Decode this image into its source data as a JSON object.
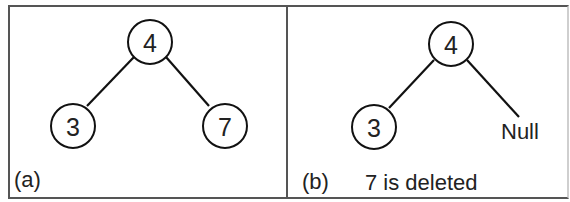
{
  "panels": [
    {
      "id": "a",
      "label": "(a)",
      "caption": "",
      "nodes": [
        {
          "value": "4",
          "role": "root"
        },
        {
          "value": "3",
          "role": "left-child"
        },
        {
          "value": "7",
          "role": "right-child"
        }
      ]
    },
    {
      "id": "b",
      "label": "(b)",
      "caption": "7 is deleted",
      "nodes": [
        {
          "value": "4",
          "role": "root"
        },
        {
          "value": "3",
          "role": "left-child"
        }
      ],
      "null_label": "Null"
    }
  ],
  "colors": {
    "stroke": "#111111",
    "border": "#555555",
    "text": "#222222"
  }
}
